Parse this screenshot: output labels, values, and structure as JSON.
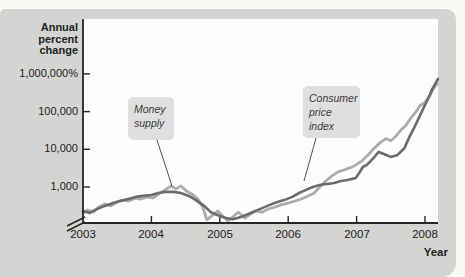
{
  "colors": {
    "page_bg": "#fbfaf4",
    "panel_bg": "#d4d4d3",
    "plot_bg": "#fdfdfd",
    "axis": "#262626",
    "cpi": "#6c6c6c",
    "money_supply": "#acacac",
    "annotation_bg": "#dfdfdf"
  },
  "figure": {
    "y_axis_title_lines": [
      "Annual",
      "percent",
      "change"
    ],
    "x_axis_title": "Year",
    "annotations": {
      "money_supply": {
        "lines": [
          "Money",
          "supply"
        ]
      },
      "cpi": {
        "lines": [
          "Consumer",
          "price",
          "index"
        ]
      }
    }
  },
  "chart_data": {
    "type": "line",
    "xlabel": "Year",
    "ylabel": "Annual percent change",
    "y_scale": "log",
    "grid": false,
    "axis_break": true,
    "x_range": [
      2003,
      2008.25
    ],
    "y_ticks": [
      {
        "value": 1000,
        "label": "1,000"
      },
      {
        "value": 10000,
        "label": "10,000"
      },
      {
        "value": 100000,
        "label": "100,000"
      },
      {
        "value": 1000000,
        "label": "1,000,000%"
      }
    ],
    "x_ticks": [
      {
        "value": 2003,
        "label": "2003"
      },
      {
        "value": 2004,
        "label": "2004"
      },
      {
        "value": 2005,
        "label": "2005"
      },
      {
        "value": 2006,
        "label": "2006"
      },
      {
        "value": 2007,
        "label": "2007"
      },
      {
        "value": 2008,
        "label": "2008"
      }
    ],
    "series": [
      {
        "name": "Money supply",
        "color_role": "money_supply",
        "points": [
          [
            2003.0,
            203
          ],
          [
            2003.07,
            245
          ],
          [
            2003.15,
            215
          ],
          [
            2003.23,
            295
          ],
          [
            2003.32,
            355
          ],
          [
            2003.41,
            315
          ],
          [
            2003.5,
            400
          ],
          [
            2003.58,
            450
          ],
          [
            2003.67,
            425
          ],
          [
            2003.76,
            510
          ],
          [
            2003.85,
            480
          ],
          [
            2003.94,
            545
          ],
          [
            2004.02,
            510
          ],
          [
            2004.11,
            655
          ],
          [
            2004.2,
            840
          ],
          [
            2004.29,
            1065
          ],
          [
            2004.36,
            890
          ],
          [
            2004.43,
            1065
          ],
          [
            2004.51,
            790
          ],
          [
            2004.59,
            655
          ],
          [
            2004.68,
            480
          ],
          [
            2004.75,
            295
          ],
          [
            2004.81,
            135
          ],
          [
            2004.97,
            230
          ],
          [
            2005.12,
            125
          ],
          [
            2005.27,
            215
          ],
          [
            2005.37,
            150
          ],
          [
            2005.44,
            190
          ],
          [
            2005.53,
            230
          ],
          [
            2005.62,
            215
          ],
          [
            2005.7,
            260
          ],
          [
            2005.81,
            295
          ],
          [
            2005.89,
            335
          ],
          [
            2006.0,
            375
          ],
          [
            2006.1,
            425
          ],
          [
            2006.19,
            480
          ],
          [
            2006.29,
            580
          ],
          [
            2006.38,
            695
          ],
          [
            2006.46,
            1000
          ],
          [
            2006.55,
            1445
          ],
          [
            2006.64,
            1965
          ],
          [
            2006.73,
            2510
          ],
          [
            2006.82,
            2840
          ],
          [
            2006.9,
            3210
          ],
          [
            2006.99,
            3860
          ],
          [
            2007.08,
            4940
          ],
          [
            2007.17,
            7140
          ],
          [
            2007.25,
            10300
          ],
          [
            2007.34,
            14900
          ],
          [
            2007.43,
            19100
          ],
          [
            2007.5,
            16900
          ],
          [
            2007.58,
            22950
          ],
          [
            2007.65,
            33000
          ],
          [
            2007.72,
            43000
          ],
          [
            2007.8,
            70000
          ],
          [
            2007.87,
            100000
          ],
          [
            2007.93,
            145000
          ],
          [
            2008.0,
            175000
          ],
          [
            2008.04,
            225000
          ],
          [
            2008.08,
            290000
          ],
          [
            2008.12,
            390000
          ],
          [
            2008.15,
            470000
          ],
          [
            2008.18,
            560000
          ]
        ]
      },
      {
        "name": "Consumer price index",
        "color_role": "cpi",
        "points": [
          [
            2003.0,
            230
          ],
          [
            2003.1,
            205
          ],
          [
            2003.2,
            260
          ],
          [
            2003.32,
            315
          ],
          [
            2003.44,
            375
          ],
          [
            2003.54,
            425
          ],
          [
            2003.66,
            480
          ],
          [
            2003.77,
            545
          ],
          [
            2003.88,
            580
          ],
          [
            2004.0,
            615
          ],
          [
            2004.1,
            695
          ],
          [
            2004.21,
            740
          ],
          [
            2004.33,
            740
          ],
          [
            2004.43,
            695
          ],
          [
            2004.55,
            580
          ],
          [
            2004.65,
            450
          ],
          [
            2004.77,
            315
          ],
          [
            2004.87,
            215
          ],
          [
            2005.0,
            170
          ],
          [
            2005.09,
            150
          ],
          [
            2005.19,
            140
          ],
          [
            2005.31,
            160
          ],
          [
            2005.41,
            190
          ],
          [
            2005.51,
            230
          ],
          [
            2005.62,
            275
          ],
          [
            2005.73,
            335
          ],
          [
            2005.84,
            400
          ],
          [
            2005.94,
            450
          ],
          [
            2006.06,
            545
          ],
          [
            2006.16,
            695
          ],
          [
            2006.26,
            840
          ],
          [
            2006.36,
            1000
          ],
          [
            2006.46,
            1130
          ],
          [
            2006.57,
            1200
          ],
          [
            2006.67,
            1280
          ],
          [
            2006.77,
            1445
          ],
          [
            2006.87,
            1535
          ],
          [
            2006.99,
            1740
          ],
          [
            2007.04,
            2400
          ],
          [
            2007.09,
            3400
          ],
          [
            2007.15,
            3860
          ],
          [
            2007.25,
            5900
          ],
          [
            2007.32,
            8500
          ],
          [
            2007.4,
            7500
          ],
          [
            2007.5,
            6300
          ],
          [
            2007.6,
            7100
          ],
          [
            2007.7,
            10800
          ],
          [
            2007.77,
            21000
          ],
          [
            2007.84,
            37000
          ],
          [
            2007.93,
            81000
          ],
          [
            2008.0,
            150000
          ],
          [
            2008.06,
            244000
          ],
          [
            2008.1,
            378000
          ],
          [
            2008.15,
            550000
          ],
          [
            2008.19,
            740000
          ]
        ]
      }
    ]
  }
}
